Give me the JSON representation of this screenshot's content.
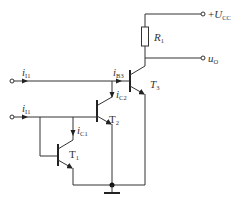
{
  "diagram": {
    "type": "circuit-schematic",
    "supply": {
      "sign": "+",
      "symbol": "U",
      "subscript": "CC"
    },
    "output": {
      "symbol": "u",
      "subscript": "O"
    },
    "resistor": {
      "symbol": "R",
      "subscript": "1"
    },
    "transistors": [
      {
        "id": "T3",
        "symbol": "T",
        "subscript": "3"
      },
      {
        "id": "T2",
        "symbol": "T",
        "subscript": "2"
      },
      {
        "id": "T1",
        "symbol": "T",
        "subscript": "1"
      }
    ],
    "currents": [
      {
        "id": "iI1-top",
        "symbol": "i",
        "subscript": "I1"
      },
      {
        "id": "iB3",
        "symbol": "i",
        "subscript": "B3"
      },
      {
        "id": "iC2",
        "symbol": "i",
        "subscript": "C2"
      },
      {
        "id": "iI1-bottom",
        "symbol": "i",
        "subscript": "I1"
      },
      {
        "id": "iC1",
        "symbol": "i",
        "subscript": "C1"
      }
    ]
  }
}
